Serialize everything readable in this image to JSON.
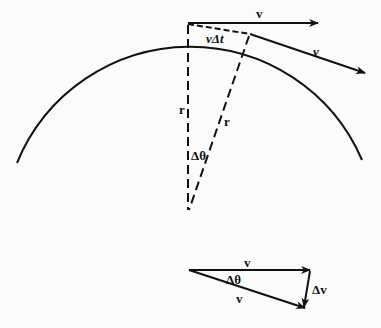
{
  "figure": {
    "type": "physics-diagram",
    "topic": "uniform circular motion velocity change",
    "colors": {
      "ink": "#111111",
      "background": "#fbfbfb"
    },
    "circle": {
      "center": [
        188,
        210
      ],
      "radius": 187,
      "arc_start": [
        17,
        163
      ],
      "arc_top": [
        188,
        23
      ],
      "arc_end": [
        362,
        160
      ]
    },
    "labels": {
      "velocity_top": "v",
      "velocity_tilted": "v",
      "chord": "vΔt",
      "radius_vertical": "r",
      "radius_slanted": "r",
      "angle_center": "Δθ",
      "triangle_v_top": "v",
      "triangle_v_bottom": "v",
      "triangle_angle": "Δθ",
      "triangle_delta_v": "Δv"
    }
  }
}
